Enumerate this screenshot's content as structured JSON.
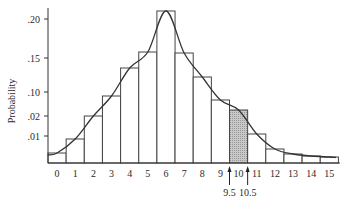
{
  "chart_data": {
    "type": "bar",
    "title": "",
    "xlabel": "",
    "ylabel": "Probability",
    "categories": [
      "0",
      "1",
      "2",
      "3",
      "4",
      "5",
      "6",
      "7",
      "8",
      "9",
      "10",
      "11",
      "12",
      "13",
      "14",
      "15"
    ],
    "values": [
      0.004,
      0.01,
      0.02,
      0.09,
      0.14,
      0.16,
      0.21,
      0.16,
      0.12,
      0.08,
      0.06,
      0.01,
      0.005,
      0.003,
      0.002,
      0.001
    ],
    "y_ticks": [
      {
        "label": ".20",
        "py": 19
      },
      {
        "label": ".15",
        "py": 58
      },
      {
        "label": ".10",
        "py": 92
      },
      {
        "label": ".02",
        "py": 116
      },
      {
        "label": ".01",
        "py": 136
      }
    ],
    "bar_tops_px": [
      153,
      139,
      116,
      96,
      68,
      52,
      11,
      53,
      77,
      100,
      110,
      134,
      149,
      154,
      156,
      157
    ],
    "highlighted_bar": 10,
    "highlight_color": "#c8c8c8",
    "overlay": "normal approximation curve",
    "annotations": [
      {
        "text": "9.5",
        "x": 9.5,
        "type": "arrow"
      },
      {
        "text": "10.5",
        "x": 10.5,
        "type": "arrow"
      }
    ],
    "grid": false,
    "legend": null
  },
  "layout": {
    "axis_x": 48,
    "baseline_y": 163,
    "axis_end_x": 340,
    "bar_width": 18.15
  }
}
